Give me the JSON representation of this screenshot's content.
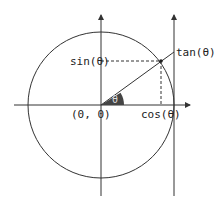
{
  "diagram": {
    "labels": {
      "sin": "sin(θ)",
      "cos": "cos(θ)",
      "tan": "tan(θ)",
      "origin": "(0, 0)",
      "angle": "θ"
    },
    "colors": {
      "stroke": "#333333",
      "angle_fill": "#444444",
      "background": "#ffffff"
    }
  }
}
